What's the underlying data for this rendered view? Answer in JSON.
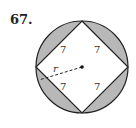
{
  "problem": {
    "number": "67."
  },
  "diagram": {
    "colors": {
      "shade": "#b8b8b8",
      "stroke": "#222222",
      "background": "#ffffff"
    },
    "square_side_labels": [
      "7",
      "7",
      "7",
      "7"
    ],
    "radius_label": "r",
    "center": [
      82,
      67
    ],
    "radius_px": 46
  }
}
